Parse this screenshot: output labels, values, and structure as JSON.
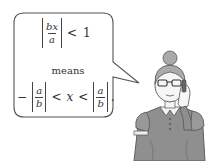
{
  "bubble": {
    "line1": {
      "numerator": "bx",
      "denominator": "a",
      "operator": "<",
      "rhs": "1"
    },
    "connector": "means",
    "line3": {
      "lead": "−",
      "left_frac": {
        "numerator": "a",
        "denominator": "b"
      },
      "op1": "<",
      "variable": "x",
      "op2": "<",
      "right_frac": {
        "numerator": "a",
        "denominator": "b"
      },
      "trailing": "."
    }
  },
  "character": {
    "description": "woman-with-glasses-on-phone"
  },
  "colors": {
    "outline": "#555555",
    "dress": "#8a8a8a",
    "skin": "#f2f2f2"
  }
}
